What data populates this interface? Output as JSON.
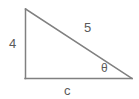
{
  "figure": {
    "type": "right-triangle-diagram",
    "background_color": "#ffffff",
    "stroke_color": "#808080",
    "text_color": "#5a5a5a",
    "stroke_width": 1.5,
    "vertices": {
      "apex": {
        "x": 25,
        "y": 9
      },
      "right_angle": {
        "x": 25,
        "y": 78
      },
      "base_right": {
        "x": 132,
        "y": 78
      }
    },
    "labels": {
      "vertical_leg": "4",
      "hypotenuse": "5",
      "angle": "θ",
      "base": "c"
    }
  }
}
